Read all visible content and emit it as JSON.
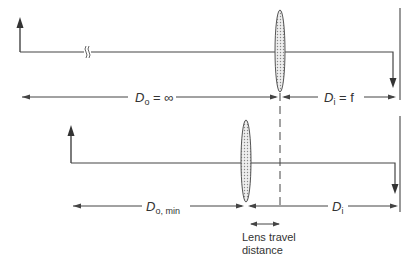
{
  "diagram": {
    "colors": {
      "line": "#444444",
      "lens_fill": "#d9d9d9",
      "text": "#333333"
    },
    "top": {
      "object_distance": {
        "symbol": "D",
        "subscript": "o",
        "relation": " = ∞"
      },
      "image_distance": {
        "symbol": "D",
        "subscript": "i",
        "relation": " = f"
      },
      "break_symbol": "≈"
    },
    "bottom": {
      "object_distance": {
        "symbol": "D",
        "subscript": "o, min",
        "relation": ""
      },
      "image_distance": {
        "symbol": "D",
        "subscript": "i",
        "relation": ""
      }
    },
    "lens_travel": {
      "line1": "Lens travel",
      "line2": "distance"
    }
  }
}
